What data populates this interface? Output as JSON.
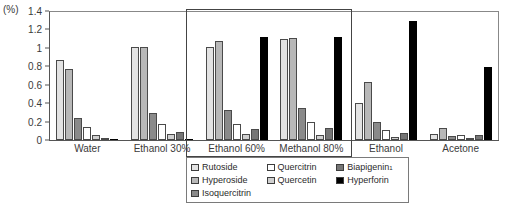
{
  "axis": {
    "unit_label": "(%)",
    "y_ticks": [
      "1.4",
      "1.2",
      "1",
      "0.8",
      "0.6",
      "0.4",
      "0.2",
      "0"
    ],
    "y_min": 0,
    "y_max": 1.4
  },
  "legend": {
    "items": [
      {
        "label": "Rutoside",
        "swatch": "#e3e3e3",
        "key": "rutoside"
      },
      {
        "label": "Quercitrin",
        "swatch": "#ffffff",
        "key": "quercitrin"
      },
      {
        "label": "Biapigenin",
        "label_sup": "1",
        "swatch": "#767676",
        "key": "biapigenin"
      },
      {
        "label": "Hyperoside",
        "swatch": "#b8b8b8",
        "key": "hyperoside"
      },
      {
        "label": "Quercetin",
        "swatch": "#d0d0d0",
        "key": "quercetin"
      },
      {
        "label": "Hyperforin",
        "swatch": "#000000",
        "key": "hyperforin"
      },
      {
        "label": "Isoquercitrin",
        "swatch": "#8a8a8a",
        "key": "isoquercitrin"
      }
    ]
  },
  "chart_data": {
    "type": "bar",
    "title": "",
    "xlabel": "",
    "ylabel": "(%)",
    "ylim": [
      0,
      1.4
    ],
    "ytick_step": 0.2,
    "grid": false,
    "legend_position": "bottom-center",
    "categories": [
      "Water",
      "Ethanol 30%",
      "Ethanol 60%",
      "Methanol 80%",
      "Ethanol",
      "Acetone"
    ],
    "series": [
      {
        "name": "Rutoside",
        "color": "#e3e3e3",
        "values": [
          0.88,
          1.02,
          1.02,
          1.1,
          0.4,
          0.07
        ]
      },
      {
        "name": "Hyperoside",
        "color": "#b8b8b8",
        "values": [
          0.78,
          1.02,
          1.08,
          1.12,
          0.63,
          0.13
        ]
      },
      {
        "name": "Isoquercitrin",
        "color": "#8a8a8a",
        "values": [
          0.24,
          0.3,
          0.33,
          0.35,
          0.2,
          0.04
        ]
      },
      {
        "name": "Quercitrin",
        "color": "#ffffff",
        "values": [
          0.14,
          0.18,
          0.18,
          0.2,
          0.11,
          0.05
        ]
      },
      {
        "name": "Quercetin",
        "color": "#d0d0d0",
        "values": [
          0.05,
          0.07,
          0.07,
          0.06,
          0.03,
          0.02
        ]
      },
      {
        "name": "Biapigenin",
        "color": "#767676",
        "values": [
          0.01,
          0.09,
          0.12,
          0.13,
          0.08,
          0.05
        ]
      },
      {
        "name": "Hyperforin",
        "color": "#000000",
        "values": [
          0.0,
          0.0,
          1.13,
          1.13,
          1.3,
          0.8
        ]
      }
    ],
    "annotations": [
      {
        "type": "highlight-rect",
        "covers": [
          "Ethanol 60%",
          "Methanol 80%"
        ]
      }
    ]
  }
}
